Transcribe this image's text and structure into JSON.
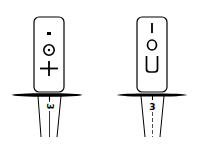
{
  "figures": [
    {
      "id": "left",
      "card_symbols": [
        "dot",
        "circled-dot",
        "plus"
      ],
      "stem_label": "3",
      "stem_label_rotation": 90
    },
    {
      "id": "right",
      "card_symbols": [
        "I",
        "O",
        "U"
      ],
      "stem_label": "3",
      "stem_label_rotation": 0
    }
  ],
  "colors": {
    "ink": "#000000",
    "background": "#ffffff"
  }
}
